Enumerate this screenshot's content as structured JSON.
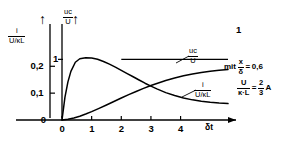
{
  "figure": {
    "kind": "line-chart",
    "background": "#ffffff",
    "ink_color": "#000000"
  },
  "axes": {
    "x": {
      "label": "δt",
      "arrow": "right-arrow-icon",
      "ticks": [
        "0",
        "1",
        "2",
        "3",
        "4"
      ],
      "tick_values": [
        0,
        1,
        2,
        3,
        4
      ],
      "range": [
        0,
        5.6
      ]
    },
    "y_left": {
      "label_num": "i",
      "label_den": "U/κL",
      "arrow": "up-arrow-icon",
      "ticks": [
        "0",
        "0,1",
        "0,2"
      ],
      "tick_values": [
        0,
        0.1,
        0.2
      ],
      "range": [
        0,
        0.35
      ]
    },
    "y_right": {
      "label_num": "uс",
      "label_den": "U",
      "arrow": "up-arrow-icon",
      "ticks": [
        "1"
      ],
      "tick_values": [
        1
      ],
      "range": [
        0,
        1.55
      ]
    }
  },
  "curve_labels": {
    "voltage": {
      "num": "uс",
      "den": "U"
    },
    "current": {
      "num": "i",
      "den": "U/κL"
    }
  },
  "asymptote": {
    "label": "1",
    "value": 1
  },
  "annotation": {
    "prefix": "mit",
    "line1": {
      "num": "x",
      "den": "δ",
      "eq": "=",
      "value": "0,6"
    },
    "line2": {
      "num": "U",
      "den": "κ·L",
      "eq": "=",
      "value_num": "2",
      "value_den": "3",
      "unit": "A"
    }
  },
  "chart_data": {
    "type": "line",
    "title": "",
    "xlabel": "δt",
    "ylabel": "i/(U/κL)  and  uс/U",
    "xlim": [
      0,
      5.6
    ],
    "ylim_left": [
      0,
      0.35
    ],
    "ylim_right": [
      0,
      1.55
    ],
    "xticks": [
      0,
      1,
      2,
      3,
      4
    ],
    "xticklabels": [
      "0",
      "1",
      "2",
      "3",
      "4"
    ],
    "yticks_left": [
      0,
      0.1,
      0.2
    ],
    "yticklabels_left": [
      "0",
      "0,1",
      "0,2"
    ],
    "yticks_right": [
      1
    ],
    "yticklabels_right": [
      "1"
    ],
    "grid": false,
    "legend": "inline-curve-labels",
    "annotations": [
      "mit x/δ = 0,6",
      "U/(κ·L) = 2/3 A"
    ],
    "series": [
      {
        "name": "i/(U/κL)",
        "axis": "left",
        "x": [
          0,
          0.1,
          0.2,
          0.3,
          0.45,
          0.6,
          0.8,
          1.0,
          1.2,
          1.4,
          1.6,
          1.8,
          2.0,
          2.2,
          2.4,
          2.6,
          2.8,
          3.0,
          3.2,
          3.5,
          3.8,
          4.1,
          4.4,
          4.7,
          5.0,
          5.3,
          5.6
        ],
        "y": [
          0,
          0.085,
          0.142,
          0.181,
          0.215,
          0.228,
          0.232,
          0.231,
          0.226,
          0.218,
          0.208,
          0.197,
          0.185,
          0.173,
          0.161,
          0.149,
          0.137,
          0.126,
          0.116,
          0.102,
          0.091,
          0.082,
          0.075,
          0.07,
          0.066,
          0.063,
          0.061
        ]
      },
      {
        "name": "uс/U",
        "axis": "right",
        "x": [
          0,
          0.2,
          0.4,
          0.6,
          0.8,
          1.0,
          1.25,
          1.5,
          1.75,
          2.0,
          2.25,
          2.5,
          2.75,
          3.0,
          3.25,
          3.5,
          3.8,
          4.1,
          4.4,
          4.7,
          5.0,
          5.3,
          5.6
        ],
        "y": [
          0,
          0.012,
          0.034,
          0.063,
          0.098,
          0.138,
          0.192,
          0.248,
          0.305,
          0.362,
          0.418,
          0.471,
          0.521,
          0.568,
          0.611,
          0.65,
          0.692,
          0.728,
          0.758,
          0.783,
          0.804,
          0.82,
          0.833
        ]
      },
      {
        "name": "asymptote",
        "axis": "right",
        "x": [
          2.0,
          5.6
        ],
        "y": [
          1.0,
          1.0
        ]
      }
    ]
  }
}
